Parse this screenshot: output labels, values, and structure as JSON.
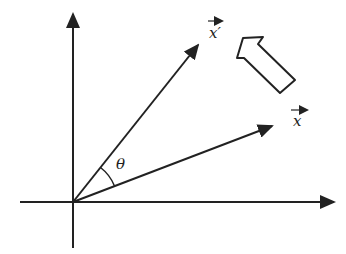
{
  "diagram": {
    "labels": {
      "rotated_vector": "x′",
      "original_vector": "x",
      "angle": "θ"
    },
    "elements": [
      {
        "type": "axis",
        "name": "x-axis",
        "direction": "horizontal",
        "arrow": "right"
      },
      {
        "type": "axis",
        "name": "y-axis",
        "direction": "vertical",
        "arrow": "up"
      },
      {
        "type": "vector",
        "name": "x",
        "from": "origin",
        "direction_deg": 20
      },
      {
        "type": "vector",
        "name": "x′",
        "from": "origin",
        "direction_deg": 52
      },
      {
        "type": "arc",
        "name": "theta",
        "between": [
          "x",
          "x′"
        ]
      },
      {
        "type": "hollow-arrow",
        "name": "rotation-direction",
        "pointing": "up-left"
      }
    ],
    "colors": {
      "stroke": "#222222",
      "background": "#ffffff"
    }
  }
}
